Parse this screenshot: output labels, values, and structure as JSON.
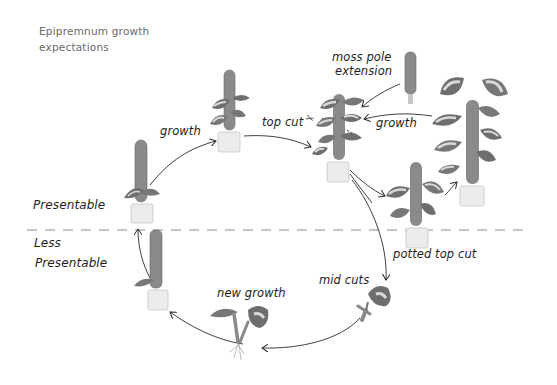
{
  "title": "Epipremnum growth expectations",
  "title_lines": [
    "Epipremnum growth",
    "expectations"
  ],
  "zones": {
    "upper": "Presentable",
    "lower_line1": "Less",
    "lower_line2": "Presentable"
  },
  "labels": {
    "growth_1": "growth",
    "top_cut": "top cut",
    "moss_pole_line1": "moss pole",
    "moss_pole_line2": "extension",
    "growth_2": "growth",
    "potted_top_cut": "potted top cut",
    "mid_cuts": "mid cuts",
    "new_growth": "new growth"
  },
  "stages": [
    {
      "id": "small-on-pole",
      "description": "small plant on moss pole, presentable"
    },
    {
      "id": "medium-on-pole",
      "description": "plant climbing moss pole"
    },
    {
      "id": "full-pole",
      "description": "plant reaching top of pole, cut point"
    },
    {
      "id": "extended-pole",
      "description": "extended moss pole with tall growth"
    },
    {
      "id": "potted-top-cut",
      "description": "top cut potted on new pole"
    },
    {
      "id": "mid-cuts",
      "description": "single leaf node cutting"
    },
    {
      "id": "new-growth",
      "description": "rooted cutting with new growth"
    },
    {
      "id": "bare-pole",
      "description": "new growth potted on bare pole, less presentable"
    }
  ],
  "colors": {
    "line": "#2a2a2a",
    "divider": "#c8c8c8",
    "leaf_dark": "#6e6e6e",
    "leaf_light": "#d9d9d9",
    "pole": "#8a8a8a",
    "pot": "#ececec"
  }
}
